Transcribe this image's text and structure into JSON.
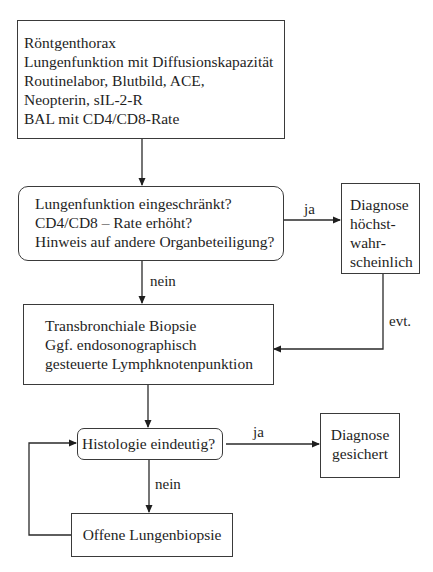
{
  "diagram": {
    "type": "flowchart",
    "nodes": {
      "initial_workup": {
        "shape": "rectangle",
        "lines": [
          "Röntgenthorax",
          "Lungenfunktion mit Diffusionskapazität",
          "Routinelabor, Blutbild, ACE,",
          "Neopterin, sIL-2-R",
          "BAL mit CD4/CD8-Rate"
        ]
      },
      "decision_1": {
        "shape": "rounded-rectangle",
        "lines": [
          "Lungenfunktion eingeschränkt?",
          "CD4/CD8 – Rate erhöht?",
          "Hinweis auf andere Organbeteiligung?"
        ]
      },
      "diagnosis_probable": {
        "shape": "rectangle",
        "lines": [
          "Diagnose",
          "höchst-",
          "wahr-",
          "scheinlich"
        ]
      },
      "biopsy": {
        "shape": "rectangle",
        "lines": [
          "Transbronchiale Biopsie",
          "Ggf. endosonographisch",
          "gesteuerte Lymphknotenpunktion"
        ]
      },
      "decision_2": {
        "shape": "rounded-rectangle",
        "lines": [
          "Histologie eindeutig?"
        ]
      },
      "diagnosis_confirmed": {
        "shape": "rectangle",
        "lines": [
          "Diagnose",
          "gesichert"
        ]
      },
      "open_biopsy": {
        "shape": "rectangle",
        "lines": [
          "Offene Lungenbiopsie"
        ]
      }
    },
    "edges": [
      {
        "from": "initial_workup",
        "to": "decision_1",
        "label": ""
      },
      {
        "from": "decision_1",
        "to": "diagnosis_probable",
        "label": "ja"
      },
      {
        "from": "decision_1",
        "to": "biopsy",
        "label": "nein"
      },
      {
        "from": "diagnosis_probable",
        "to": "biopsy",
        "label": "evt."
      },
      {
        "from": "biopsy",
        "to": "decision_2",
        "label": ""
      },
      {
        "from": "decision_2",
        "to": "diagnosis_confirmed",
        "label": "ja"
      },
      {
        "from": "decision_2",
        "to": "open_biopsy",
        "label": "nein"
      },
      {
        "from": "open_biopsy",
        "to": "decision_2",
        "label": ""
      }
    ],
    "labels": {
      "ja_1": "ja",
      "nein_1": "nein",
      "evt": "evt.",
      "ja_2": "ja",
      "nein_2": "nein"
    }
  }
}
